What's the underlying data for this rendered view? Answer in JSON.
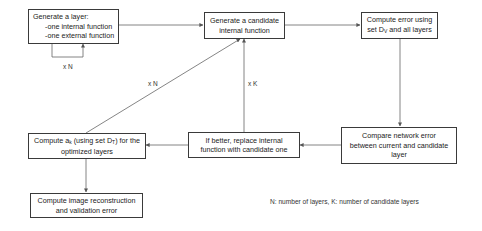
{
  "diagram": {
    "type": "flowchart",
    "nodes": [
      {
        "id": "gen_layer",
        "lines": [
          "Generate a layer:",
          "-one internal function",
          "-one external function"
        ]
      },
      {
        "id": "gen_candidate",
        "lines": [
          "Generate a candidate",
          "internal function"
        ]
      },
      {
        "id": "compute_error",
        "line1_pre": "Compute error using",
        "line2_pre": "set D",
        "line2_sub": "V",
        "line2_post": " and all layers"
      },
      {
        "id": "compare",
        "lines": [
          "Compare network error",
          "between current and candidate",
          "layer"
        ]
      },
      {
        "id": "replace",
        "lines": [
          "If better, replace internal",
          "function with candidate one"
        ]
      },
      {
        "id": "compute_a",
        "line1_pre": "Compute a",
        "line1_sub": "k",
        "line1_mid": " (using set D",
        "line1_sub2": "T",
        "line1_post": ") for the",
        "line2": "optimized layers"
      },
      {
        "id": "reconstruct",
        "lines": [
          "Compute image reconstruction",
          "and validation error"
        ]
      }
    ],
    "edge_labels": {
      "loop_layer": "x N",
      "to_candidate_N": "x N",
      "to_candidate_K": "x K"
    },
    "legend": "N: number of layers, K: number of candidate layers",
    "colors": {
      "stroke": "#3a3a3a",
      "background": "#ffffff",
      "text": "#222222"
    }
  }
}
